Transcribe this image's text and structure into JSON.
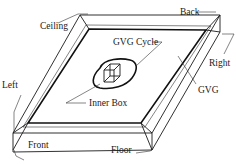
{
  "diagram": {
    "labels": {
      "ceiling": "Ceiling",
      "back": "Back",
      "gvg_cycle": "GVG Cycle",
      "right": "Right",
      "left": "Left",
      "gvg": "GVG",
      "inner_box": "Inner Box",
      "front": "Front",
      "floor": "Floor"
    },
    "colors": {
      "line": "#1a1a1a",
      "background": "#ffffff"
    }
  }
}
